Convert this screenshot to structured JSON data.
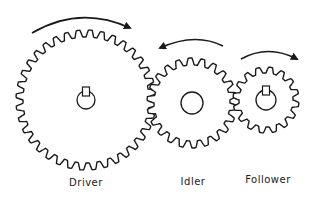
{
  "diagram": {
    "title": "",
    "colors": {
      "stroke": "#1a1a1a",
      "background": "#ffffff"
    },
    "gears": [
      {
        "id": "driver",
        "label": "Driver",
        "cx": 86,
        "cy": 100,
        "r_outer": 70,
        "r_root": 63,
        "teeth": 36,
        "bore_r": 9,
        "keyway": true,
        "rotation": "clockwise",
        "label_x": 86,
        "label_y": 177
      },
      {
        "id": "idler",
        "label": "Idler",
        "cx": 192,
        "cy": 103,
        "r_outer": 45,
        "r_root": 38,
        "teeth": 22,
        "bore_r": 11,
        "keyway": false,
        "rotation": "counterclockwise",
        "label_x": 193,
        "label_y": 176
      },
      {
        "id": "follower",
        "label": "Follower",
        "cx": 266,
        "cy": 100,
        "r_outer": 33,
        "r_root": 27,
        "teeth": 16,
        "bore_r": 10,
        "keyway": true,
        "rotation": "clockwise",
        "label_x": 268,
        "label_y": 174
      }
    ]
  }
}
